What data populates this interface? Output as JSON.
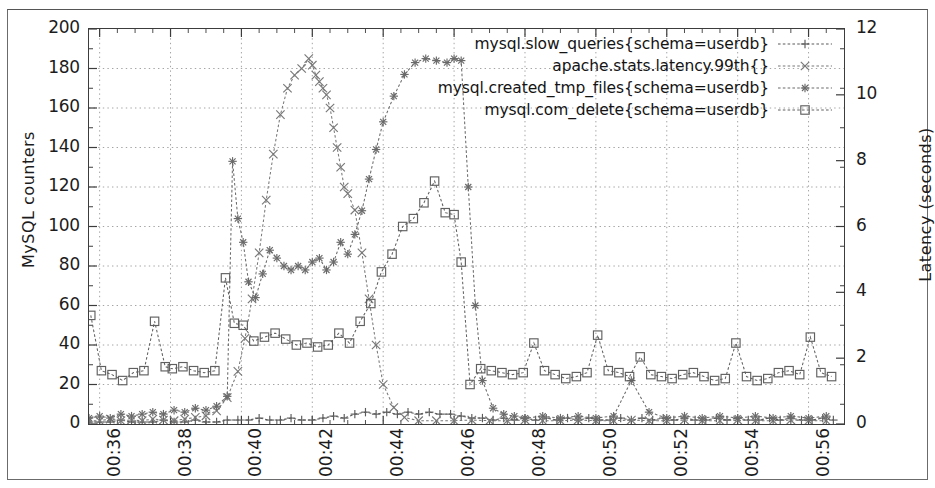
{
  "figure": {
    "kind": "line-chart",
    "background_color": "#ffffff",
    "frame_color": "#3c3c3c",
    "ink_color": "#555555",
    "grid_color": "#9a9a9a"
  },
  "chart_data": {
    "type": "line",
    "title": "",
    "subtitle": "",
    "xlabel": "",
    "ylabel": "MySQL counters",
    "y2label": "Latency (seconds)",
    "grid": true,
    "legend_position": "top-right",
    "xtick_labels": [
      "00:36",
      "00:38",
      "00:40",
      "00:42",
      "00:44",
      "00:46",
      "00:48",
      "00:50",
      "00:52",
      "00:54",
      "00:56"
    ],
    "xtick_values": [
      36,
      38,
      40,
      42,
      44,
      46,
      48,
      50,
      52,
      54,
      56
    ],
    "xlim": [
      35.7,
      57.0
    ],
    "ylim": [
      0,
      200
    ],
    "ytick_values": [
      0,
      20,
      40,
      60,
      80,
      100,
      120,
      140,
      160,
      180,
      200
    ],
    "y2lim": [
      0,
      12
    ],
    "y2tick_values": [
      0,
      2,
      4,
      6,
      8,
      10,
      12
    ],
    "minor_xticks_per_major": 4,
    "minor_yticks_per_major": 2,
    "series": [
      {
        "name": "mysql.slow_queries{schema=userdb}",
        "marker": "plus",
        "axis": "left",
        "color": "#5a5a5a",
        "x": [
          35.7,
          36.0,
          36.3,
          36.6,
          36.9,
          37.2,
          37.5,
          37.8,
          38.1,
          38.4,
          38.7,
          39.0,
          39.3,
          39.6,
          39.9,
          40.2,
          40.5,
          40.8,
          41.1,
          41.4,
          41.7,
          42.0,
          42.3,
          42.6,
          42.9,
          43.2,
          43.5,
          43.8,
          44.1,
          44.4,
          44.7,
          45.0,
          45.3,
          45.6,
          45.9,
          46.2,
          46.5,
          46.8,
          47.1,
          47.4,
          47.7,
          48.0,
          48.3,
          48.6,
          48.9,
          49.2,
          49.5,
          49.8,
          50.1,
          50.4,
          50.7,
          51.0,
          51.3,
          51.6,
          51.9,
          52.2,
          52.5,
          52.8,
          53.1,
          53.4,
          53.7,
          54.0,
          54.3,
          54.6,
          54.9,
          55.2,
          55.5,
          55.8,
          56.1,
          56.4,
          56.7
        ],
        "y": [
          1,
          1,
          1,
          2,
          1,
          1,
          1,
          2,
          1,
          1,
          2,
          1,
          1,
          2,
          2,
          2,
          3,
          2,
          2,
          3,
          2,
          2,
          3,
          4,
          3,
          5,
          6,
          5,
          6,
          5,
          6,
          5,
          6,
          5,
          5,
          4,
          3,
          3,
          2,
          3,
          2,
          3,
          2,
          3,
          2,
          3,
          2,
          3,
          2,
          2,
          3,
          2,
          3,
          2,
          3,
          2,
          3,
          2,
          2,
          3,
          2,
          3,
          2,
          2,
          3,
          2,
          3,
          2,
          2,
          3,
          2
        ]
      },
      {
        "name": "apache.stats.latency.99th{}",
        "marker": "cross",
        "axis": "right",
        "color": "#787878",
        "x": [
          35.7,
          36.0,
          36.3,
          36.6,
          36.9,
          37.2,
          37.5,
          37.8,
          38.1,
          38.4,
          38.7,
          39.0,
          39.3,
          39.6,
          39.9,
          40.1,
          40.3,
          40.5,
          40.7,
          40.9,
          41.1,
          41.3,
          41.5,
          41.7,
          41.9,
          42.0,
          42.1,
          42.2,
          42.3,
          42.4,
          42.5,
          42.6,
          42.7,
          42.8,
          42.9,
          43.0,
          43.2,
          43.4,
          43.6,
          43.8,
          44.0,
          44.3,
          44.6,
          45.0,
          45.5,
          46.0,
          46.5,
          47.0,
          47.5,
          48.0,
          48.5,
          49.0,
          49.5,
          50.0,
          50.5,
          51.0,
          51.5,
          52.0,
          52.5,
          53.0,
          53.5,
          54.0,
          54.5,
          55.0,
          55.5,
          56.0,
          56.5
        ],
        "y": [
          0.1,
          0.1,
          0.15,
          0.1,
          0.12,
          0.1,
          0.15,
          0.12,
          0.1,
          0.15,
          0.2,
          0.25,
          0.4,
          0.8,
          1.6,
          2.6,
          3.8,
          5.2,
          6.8,
          8.2,
          9.4,
          10.2,
          10.6,
          10.8,
          11.1,
          10.9,
          10.6,
          10.4,
          10.2,
          10.0,
          9.6,
          9.0,
          8.4,
          7.8,
          7.2,
          7.0,
          6.5,
          5.2,
          3.8,
          2.4,
          1.2,
          0.5,
          0.2,
          0.1,
          0.1,
          0.1,
          0.12,
          0.1,
          0.1,
          0.12,
          0.1,
          0.1,
          0.12,
          0.1,
          0.1,
          0.12,
          0.1,
          0.1,
          0.12,
          0.1,
          0.1,
          0.12,
          0.1,
          0.1,
          0.12,
          0.1,
          0.1
        ]
      },
      {
        "name": "mysql.created_tmp_files{schema=userdb}",
        "marker": "star",
        "axis": "left",
        "color": "#6a6a6a",
        "x": [
          35.7,
          36.0,
          36.3,
          36.6,
          36.9,
          37.2,
          37.5,
          37.8,
          38.1,
          38.4,
          38.7,
          39.0,
          39.3,
          39.6,
          39.75,
          39.9,
          40.05,
          40.2,
          40.4,
          40.6,
          40.8,
          41.0,
          41.2,
          41.4,
          41.6,
          41.8,
          42.0,
          42.2,
          42.4,
          42.6,
          42.8,
          43.0,
          43.2,
          43.4,
          43.6,
          43.8,
          44.0,
          44.3,
          44.6,
          44.9,
          45.2,
          45.5,
          45.8,
          46.0,
          46.2,
          46.4,
          46.6,
          46.8,
          47.1,
          47.4,
          47.7,
          48.0,
          48.5,
          49.0,
          49.5,
          50.0,
          50.5,
          51.0,
          51.5,
          52.0,
          52.5,
          53.0,
          53.5,
          54.0,
          54.5,
          55.0,
          55.5,
          56.0,
          56.5
        ],
        "y": [
          3,
          4,
          3,
          5,
          4,
          5,
          6,
          5,
          7,
          6,
          8,
          7,
          9,
          14,
          133,
          104,
          92,
          72,
          64,
          76,
          88,
          84,
          80,
          78,
          80,
          78,
          82,
          84,
          78,
          82,
          92,
          86,
          96,
          108,
          124,
          139,
          153,
          166,
          177,
          183,
          185,
          184,
          183,
          185,
          184,
          120,
          60,
          22,
          8,
          5,
          4,
          3,
          4,
          3,
          4,
          3,
          4,
          22,
          6,
          3,
          4,
          3,
          4,
          3,
          4,
          3,
          4,
          3,
          4
        ]
      },
      {
        "name": "mysql.com_delete{schema=userdb}",
        "marker": "square",
        "axis": "left",
        "color": "#606060",
        "x": [
          35.75,
          36.05,
          36.35,
          36.65,
          36.95,
          37.25,
          37.55,
          37.85,
          38.05,
          38.35,
          38.65,
          38.95,
          39.25,
          39.55,
          39.8,
          40.05,
          40.35,
          40.65,
          40.95,
          41.25,
          41.55,
          41.85,
          42.15,
          42.45,
          42.75,
          43.05,
          43.35,
          43.65,
          43.95,
          44.25,
          44.55,
          44.85,
          45.15,
          45.45,
          45.75,
          46.0,
          46.2,
          46.45,
          46.75,
          47.05,
          47.35,
          47.65,
          47.95,
          48.25,
          48.55,
          48.85,
          49.15,
          49.45,
          49.75,
          50.05,
          50.35,
          50.65,
          50.95,
          51.25,
          51.55,
          51.85,
          52.15,
          52.45,
          52.75,
          53.05,
          53.35,
          53.65,
          53.95,
          54.25,
          54.55,
          54.85,
          55.15,
          55.45,
          55.75,
          56.05,
          56.35,
          56.65
        ],
        "y": [
          55,
          27,
          25,
          22,
          26,
          27,
          52,
          29,
          28,
          29,
          27,
          26,
          27,
          74,
          51,
          50,
          42,
          44,
          46,
          43,
          40,
          41,
          39,
          40,
          46,
          41,
          52,
          61,
          77,
          86,
          100,
          104,
          112,
          123,
          107,
          106,
          82,
          20,
          28,
          27,
          26,
          25,
          26,
          41,
          27,
          25,
          23,
          24,
          26,
          45,
          27,
          26,
          24,
          34,
          25,
          24,
          23,
          25,
          26,
          24,
          22,
          23,
          41,
          24,
          22,
          23,
          26,
          27,
          25,
          44,
          26,
          24
        ]
      }
    ]
  },
  "legend": {
    "items": [
      {
        "label": "mysql.slow_queries{schema=userdb}",
        "marker": "plus"
      },
      {
        "label": "apache.stats.latency.99th{}",
        "marker": "cross"
      },
      {
        "label": "mysql.created_tmp_files{schema=userdb}",
        "marker": "star"
      },
      {
        "label": "mysql.com_delete{schema=userdb}",
        "marker": "square"
      }
    ]
  }
}
